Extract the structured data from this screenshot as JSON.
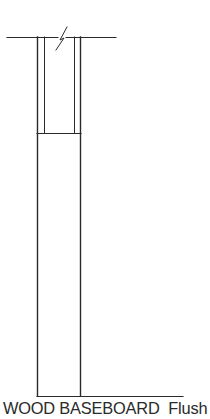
{
  "diagram": {
    "type": "architectural-detail",
    "caption": {
      "title": "WOOD BASEBOARD",
      "variant": "Flush",
      "full": "WOOD BASEBOARD  Flush"
    },
    "stroke_color": "#2a2a2a",
    "elements": {
      "wall_line": {
        "y": 37,
        "x_start": 7,
        "x_end": 116,
        "break_symbol": true
      },
      "upper_wall": {
        "x_outer_left": 37,
        "x_inner_left": 44,
        "x_inner_right": 74,
        "x_outer_right": 80,
        "y_top": 37,
        "y_bottom": 133
      },
      "baseboard": {
        "x_left": 37,
        "x_right": 80,
        "y_top": 133,
        "y_bottom": 396
      },
      "floor_line": {
        "y": 396,
        "x_start": 37,
        "x_end": 183
      }
    }
  }
}
